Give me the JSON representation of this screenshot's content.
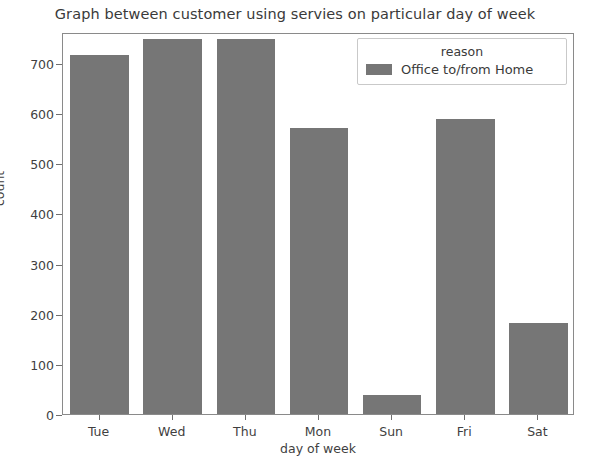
{
  "chart_data": {
    "type": "bar",
    "title": "Graph between customer using servies on particular day of week",
    "xlabel": "day of week",
    "ylabel": "count",
    "categories": [
      "Tue",
      "Wed",
      "Thu",
      "Mon",
      "Sun",
      "Fri",
      "Sat"
    ],
    "values": [
      716,
      748,
      748,
      570,
      37,
      588,
      182
    ],
    "series": [
      {
        "name": "Office to/from Home",
        "values": [
          716,
          748,
          748,
          570,
          37,
          588,
          182
        ]
      }
    ],
    "ylim": [
      0,
      762
    ],
    "ytick_labels": [
      "0",
      "100",
      "200",
      "300",
      "400",
      "500",
      "600",
      "700"
    ],
    "ytick_values": [
      0,
      100,
      200,
      300,
      400,
      500,
      600,
      700
    ],
    "grid": false,
    "legend_position": "upper right",
    "legend": {
      "title": "reason",
      "entries": [
        {
          "label": "Office to/from Home",
          "color": "#767676"
        }
      ]
    },
    "bar_color": "#767676"
  }
}
